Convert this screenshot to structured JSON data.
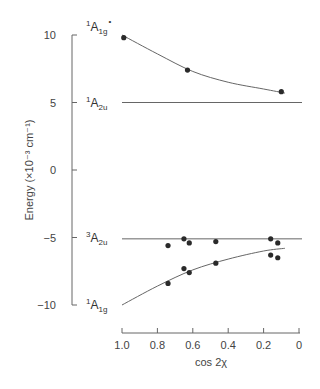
{
  "chart_data": {
    "type": "scatter",
    "title": "",
    "xlabel": "cos 2χ",
    "ylabel": "Energy  (×10⁻³ cm⁻¹)",
    "xlim": [
      1.0,
      0
    ],
    "ylim": [
      -10,
      10
    ],
    "x_ticks": [
      "1.0",
      "0.8",
      "0.6",
      "0.4",
      "0.2",
      "0"
    ],
    "y_ticks": [
      "10",
      "5",
      "0",
      "−5",
      "−10"
    ],
    "grid": false,
    "legend": "none (curves labeled directly)",
    "series": [
      {
        "name": "¹A1g* (upper)",
        "label_main": "A",
        "label_sup": "1",
        "label_sub": "1g",
        "label_star": "*",
        "kind": "points+curve",
        "x": [
          0.99,
          0.63,
          0.1
        ],
        "y": [
          9.8,
          7.4,
          5.8
        ],
        "curve_x": [
          1.0,
          0.8,
          0.6,
          0.4,
          0.2,
          0.08
        ],
        "curve_y": [
          10.0,
          8.6,
          7.3,
          6.5,
          6.0,
          5.7
        ]
      },
      {
        "name": "¹A2u",
        "label_main": "A",
        "label_sup": "1",
        "label_sub": "2u",
        "kind": "line",
        "x": [
          1.0,
          0.0
        ],
        "y": [
          5.0,
          5.0
        ]
      },
      {
        "name": "³A2u",
        "label_main": "A",
        "label_sup": "3",
        "label_sub": "2u",
        "kind": "points+line",
        "x": [
          0.74,
          0.65,
          0.62,
          0.47,
          0.16,
          0.12
        ],
        "y": [
          -5.6,
          -5.1,
          -5.4,
          -5.3,
          -5.1,
          -5.4
        ],
        "line_y": -5.1
      },
      {
        "name": "¹A1g (lower)",
        "label_main": "A",
        "label_sup": "1",
        "label_sub": "1g",
        "kind": "points+curve",
        "x": [
          0.74,
          0.65,
          0.62,
          0.47,
          0.16,
          0.12
        ],
        "y": [
          -8.4,
          -7.3,
          -7.6,
          -6.9,
          -6.3,
          -6.5
        ],
        "curve_x": [
          1.0,
          0.8,
          0.6,
          0.4,
          0.2,
          0.08
        ],
        "curve_y": [
          -10.0,
          -8.6,
          -7.4,
          -6.6,
          -6.0,
          -5.8
        ]
      }
    ]
  }
}
